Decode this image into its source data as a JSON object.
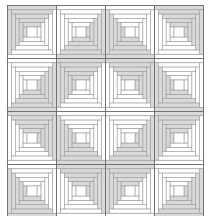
{
  "figure": {
    "type": "log-cabin-quilt",
    "rows": 4,
    "cols": 4,
    "block_width": 49,
    "block_height": 53,
    "rings": 5,
    "colors": {
      "dark": "#d9d9d9",
      "light": "#ffffff",
      "line": "#9a9a9a",
      "grid": "#6e6e6e"
    },
    "blocks": [
      [
        "TL",
        "BR",
        "BL",
        "TR"
      ],
      [
        "BR",
        "TL",
        "TR",
        "BL"
      ],
      [
        "TR",
        "BL",
        "BR",
        "TL"
      ],
      [
        "BL",
        "TR",
        "TL",
        "BR"
      ]
    ]
  }
}
